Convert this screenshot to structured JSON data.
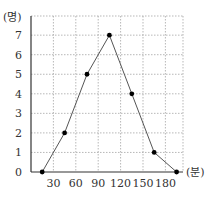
{
  "chart_data": {
    "type": "line",
    "title": "",
    "xlabel": "(분)",
    "ylabel": "(명)",
    "x_ticks": [
      "30",
      "60",
      "90",
      "120",
      "150",
      "180"
    ],
    "y_ticks": [
      "0",
      "1",
      "2",
      "3",
      "4",
      "5",
      "6",
      "7"
    ],
    "xlim": [
      0,
      200
    ],
    "ylim": [
      0,
      7.8
    ],
    "grid": true,
    "legend": null,
    "series": [
      {
        "name": "frequency polygon",
        "x": [
          15,
          45,
          75,
          105,
          135,
          165,
          195
        ],
        "y": [
          0,
          2,
          5,
          7,
          4,
          1,
          0
        ]
      }
    ],
    "colors": {
      "line": "#555555",
      "marker": "#000000",
      "grid": "#999999",
      "axis": "#333333"
    }
  }
}
